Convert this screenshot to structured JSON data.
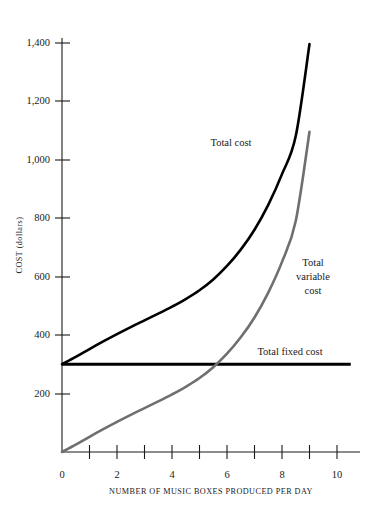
{
  "chart_data": {
    "type": "line",
    "title": "",
    "xlabel": "NUMBER OF MUSIC BOXES PRODUCED PER DAY",
    "ylabel": "COST (dollars)",
    "xlim": [
      0,
      11
    ],
    "ylim": [
      0,
      1480
    ],
    "grid": false,
    "legend_position": "inline-labels",
    "xticks": [
      "0",
      "2",
      "4",
      "6",
      "8",
      "10"
    ],
    "xtick_values": [
      0,
      2,
      4,
      6,
      8,
      10
    ],
    "xtick_minor_values": [
      1,
      3,
      5,
      7,
      9
    ],
    "yticks": [
      "200",
      "400",
      "600",
      "800",
      "1,000",
      "1,200",
      "1,400"
    ],
    "ytick_values": [
      200,
      400,
      600,
      800,
      1000,
      1200,
      1400
    ],
    "yzero_label": "0",
    "series": [
      {
        "name": "Total cost",
        "color": "#000000",
        "x": [
          0,
          0.5,
          1,
          1.5,
          2,
          2.5,
          3,
          3.5,
          4,
          4.5,
          5,
          5.5,
          6,
          6.5,
          7,
          7.5,
          8,
          8.5,
          9
        ],
        "values": [
          300,
          325,
          352,
          378,
          403,
          427,
          450,
          473,
          497,
          523,
          553,
          590,
          636,
          692,
          760,
          845,
          950,
          1080,
          1395
        ]
      },
      {
        "name": "Total variable cost",
        "color": "#6f6f6f",
        "x": [
          0,
          0.5,
          1,
          1.5,
          2,
          2.5,
          3,
          3.5,
          4,
          4.5,
          5,
          5.5,
          6,
          6.5,
          7,
          7.5,
          8,
          8.5,
          9
        ],
        "values": [
          0,
          25,
          52,
          78,
          103,
          127,
          150,
          173,
          197,
          223,
          253,
          290,
          336,
          392,
          460,
          545,
          650,
          790,
          1095
        ]
      },
      {
        "name": "Total fixed cost",
        "color": "#000000",
        "x": [
          0,
          10.5
        ],
        "values": [
          300,
          300
        ]
      }
    ],
    "annotations": [
      {
        "text": "Total cost",
        "x": 6.0,
        "y": 1060
      },
      {
        "text": "Total variable cost",
        "x": 9.3,
        "y": 690
      },
      {
        "text": "Total fixed cost",
        "x": 8.5,
        "y": 355
      }
    ]
  },
  "labels": {
    "total_cost": "Total cost",
    "variable_line1": "Total",
    "variable_line2": "variable",
    "variable_line3": "cost",
    "total_fixed_cost": "Total fixed cost",
    "x_axis_title": "NUMBER OF MUSIC BOXES PRODUCED PER DAY",
    "y_axis_title": "COST (dollars)"
  },
  "ytick_labels": {
    "t0": "0",
    "t200": "200",
    "t400": "400",
    "t600": "600",
    "t800": "800",
    "t1000": "1,000",
    "t1200": "1,200",
    "t1400": "1,400"
  },
  "xtick_labels": {
    "t0": "0",
    "t2": "2",
    "t4": "4",
    "t6": "6",
    "t8": "8",
    "t10": "10"
  },
  "colors": {
    "total_cost": "#000000",
    "variable_cost": "#6f6f6f",
    "fixed_cost": "#000000",
    "axis": "#1a1a1a",
    "background": "#ffffff"
  }
}
